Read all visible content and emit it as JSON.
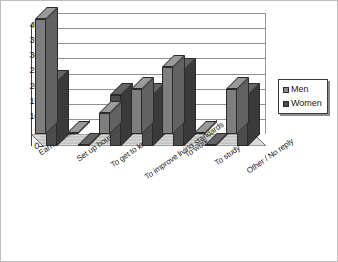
{
  "chart_data": {
    "type": "bar",
    "title": "",
    "xlabel": "",
    "ylabel": "",
    "ylim": [
      0,
      40
    ],
    "yticks": [
      0,
      5,
      10,
      15,
      20,
      25,
      30,
      35,
      40
    ],
    "grid": true,
    "legend_position": "right",
    "style": "3d-clustered-column",
    "categories": [
      "Earn money",
      "Set up house",
      "To get to know",
      "To improve living standards",
      "To work",
      "To study",
      "Other / No reply"
    ],
    "series": [
      {
        "name": "Men",
        "color": "#7e7e7e",
        "values": [
          38,
          0,
          7,
          15,
          22,
          0,
          15
        ]
      },
      {
        "name": "Women",
        "color": "#4c4c4c",
        "values": [
          21,
          0,
          17,
          17,
          25,
          0,
          17
        ]
      }
    ]
  },
  "legend": {
    "items": [
      {
        "label": "Men"
      },
      {
        "label": "Women"
      }
    ]
  },
  "axis": {
    "tick_labels": [
      "40",
      "35",
      "30",
      "25",
      "20",
      "15",
      "10",
      "5",
      "0"
    ]
  }
}
